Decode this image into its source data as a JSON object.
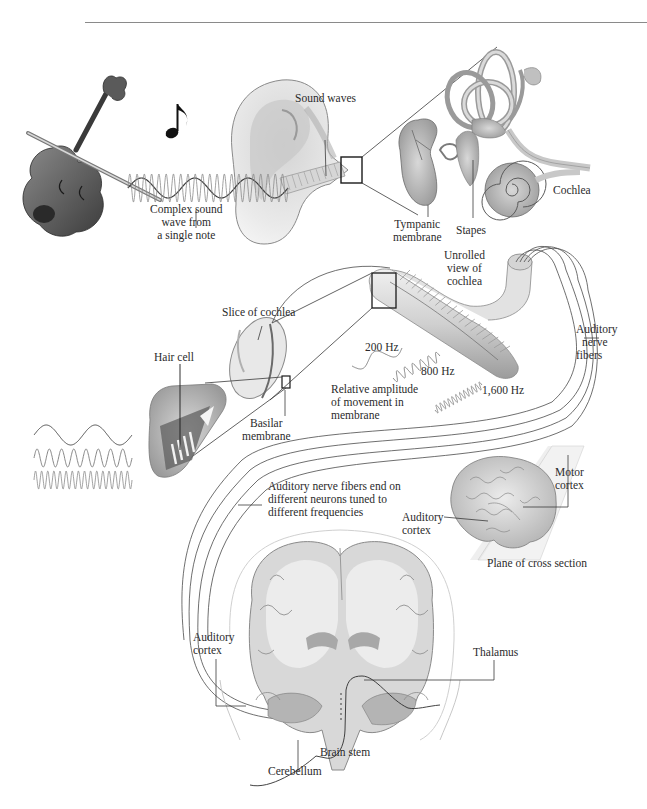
{
  "figure": {
    "colors": {
      "ink": "#2b2b2b",
      "line": "#3a3a3a",
      "tissue_light": "#e6e6e6",
      "tissue_mid": "#b8b8b8",
      "tissue_dark": "#6a6a6a",
      "background": "#ffffff"
    },
    "icons": {
      "music_note": "eighth-note-icon",
      "violin": "violin-illustration",
      "ear": "outer-ear-illustration",
      "inner_ear": "inner-ear-illustration",
      "brain_lateral": "brain-lateral-illustration",
      "brain_coronal": "brain-coronal-section-illustration"
    }
  },
  "labels": {
    "complex_wave": [
      "Complex sound",
      "wave from",
      "a single note"
    ],
    "sound_waves": "Sound waves",
    "tympanic": [
      "Tympanic",
      "membrane"
    ],
    "stapes": "Stapes",
    "cochlea": "Cochlea",
    "unrolled": [
      "Unrolled",
      "view of",
      "cochlea"
    ],
    "slice": "Slice of cochlea",
    "hair_cell": "Hair cell",
    "basilar": [
      "Basilar",
      "membrane"
    ],
    "hz200": "200 Hz",
    "hz800": "800 Hz",
    "hz1600": "1,600 Hz",
    "relative_amp": [
      "Relative amplitude",
      "of movement in",
      "membrane"
    ],
    "nerve_fibers": [
      "Auditory",
      "nerve",
      "fibers"
    ],
    "fibers_end": [
      "Auditory nerve fibers end on",
      "different neurons tuned to",
      "different frequencies"
    ],
    "motor_cortex": [
      "Motor",
      "cortex"
    ],
    "aud_cortex_right": [
      "Auditory",
      "cortex"
    ],
    "plane": "Plane of cross section",
    "aud_cortex_left": [
      "Auditory",
      "cortex"
    ],
    "thalamus": "Thalamus",
    "brain_stem": "Brain stem",
    "cerebellum": "Cerebellum"
  },
  "waves": {
    "components": [
      {
        "name": "low",
        "cycles": 2
      },
      {
        "name": "mid",
        "cycles": 8
      },
      {
        "name": "high",
        "cycles": 16
      }
    ]
  }
}
